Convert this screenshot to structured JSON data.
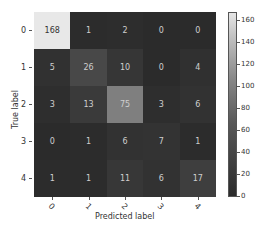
{
  "chart_data": {
    "type": "heatmap",
    "title": "",
    "xlabel": "Predicted label",
    "ylabel": "True label",
    "x_tick_labels": [
      "0",
      "1",
      "2",
      "3",
      "4"
    ],
    "y_tick_labels": [
      "0",
      "1",
      "2",
      "3",
      "4"
    ],
    "matrix": [
      [
        168,
        1,
        2,
        0,
        0
      ],
      [
        5,
        26,
        10,
        0,
        4
      ],
      [
        3,
        13,
        75,
        3,
        6
      ],
      [
        0,
        1,
        6,
        7,
        1
      ],
      [
        1,
        1,
        11,
        6,
        17
      ]
    ],
    "colorbar": {
      "ticks": [
        "0",
        "20",
        "40",
        "60",
        "80",
        "100",
        "120",
        "140",
        "160"
      ],
      "range": [
        0,
        168
      ],
      "colormap": "gray"
    }
  }
}
